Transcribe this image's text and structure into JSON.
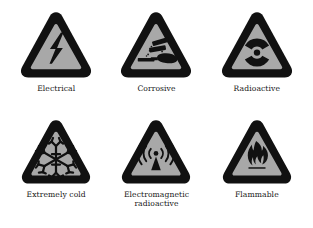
{
  "page": {
    "background_color": "#ffffff",
    "sign_border_color": "#111111",
    "sign_fill_color": "#a8a8a8",
    "label_color": "#141414"
  },
  "signs": [
    {
      "label": "Electrical",
      "icon": "high-voltage-lightning-bolt-icon",
      "shape": "rounded-triangle",
      "row": 1,
      "column": 1
    },
    {
      "label": "Corrosive",
      "icon": "corrosive-test-tubes-hand-icon",
      "shape": "rounded-triangle",
      "row": 1,
      "column": 2
    },
    {
      "label": "Radioactive",
      "icon": "radioactive-trefoil-icon",
      "shape": "rounded-triangle",
      "row": 1,
      "column": 3
    },
    {
      "label": "Extremely cold",
      "icon": "snowflake-icon",
      "shape": "rounded-triangle",
      "row": 2,
      "column": 1
    },
    {
      "label": "Electromagnetic radioactive",
      "label_line_1": "Electromagnetic",
      "label_line_2": "radioactive",
      "icon": "electromagnetic-antenna-waves-icon",
      "shape": "rounded-triangle",
      "row": 2,
      "column": 2
    },
    {
      "label": "Flammable",
      "icon": "flame-icon",
      "shape": "rounded-triangle",
      "row": 2,
      "column": 3
    }
  ]
}
